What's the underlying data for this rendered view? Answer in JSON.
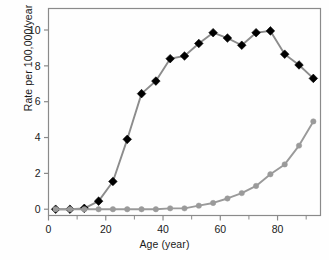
{
  "chart_data": {
    "type": "line",
    "title": "",
    "xlabel": "Age (year)",
    "ylabel": "Rate per 100,000/year",
    "xlim": [
      0,
      95
    ],
    "ylim": [
      -0.35,
      11.2
    ],
    "xticks": [
      0,
      20,
      40,
      60,
      80
    ],
    "xticklabels": [
      "0",
      "20",
      "40",
      "60",
      "80"
    ],
    "xminorticks": [
      10,
      30,
      50,
      70,
      90
    ],
    "yticks": [
      0,
      2,
      4,
      6,
      8,
      10
    ],
    "yticklabels": [
      "0",
      "2",
      "4",
      "6",
      "8",
      "10"
    ],
    "grid": false,
    "legend": "none",
    "x": [
      2.5,
      7.5,
      12.5,
      17.5,
      22.5,
      27.5,
      32.5,
      37.5,
      42.5,
      47.5,
      52.5,
      57.5,
      62.5,
      67.5,
      72.5,
      77.5,
      82.5,
      87.5,
      92.5
    ],
    "series": [
      {
        "name": "black-diamond-series",
        "marker": "diamond",
        "marker_color": "#000000",
        "line_color": "#8c8c8c",
        "values": [
          0.0,
          0.0,
          0.05,
          0.45,
          1.55,
          3.9,
          6.45,
          7.15,
          8.4,
          8.55,
          9.25,
          9.85,
          9.55,
          9.15,
          9.85,
          9.95,
          8.65,
          8.05,
          7.3
        ]
      },
      {
        "name": "gray-circle-series",
        "marker": "circle",
        "marker_color": "#9a9a9a",
        "line_color": "#9a9a9a",
        "values": [
          0.0,
          0.0,
          0.0,
          0.0,
          0.0,
          0.0,
          0.0,
          0.0,
          0.05,
          0.05,
          0.2,
          0.35,
          0.6,
          0.9,
          1.3,
          1.95,
          2.5,
          3.55,
          4.9
        ]
      }
    ]
  },
  "axes": {
    "frame_color": "#8a8a8a",
    "text_color": "#1a1a1a"
  }
}
